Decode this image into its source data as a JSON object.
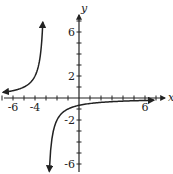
{
  "chart_data": {
    "type": "line",
    "title": "",
    "xlabel": "x",
    "ylabel": "y",
    "xlim": [
      -7,
      7
    ],
    "ylim": [
      -7,
      7
    ],
    "x_tick_labels": [
      "-6",
      "-4",
      "6"
    ],
    "y_tick_labels": [
      "6",
      "2",
      "-2",
      "-6"
    ],
    "grid": false,
    "function": "y = -2/(x+3)",
    "asymptotes": {
      "vertical": -3,
      "horizontal": 0
    },
    "series": [
      {
        "name": "left branch",
        "x": [
          -7,
          -6,
          -5,
          -4,
          -3.5,
          -3.3
        ],
        "y": [
          0.5,
          0.67,
          1,
          2,
          4,
          6.7
        ]
      },
      {
        "name": "right branch",
        "x": [
          -2.7,
          -2.5,
          -2,
          -1,
          0,
          2,
          4,
          6,
          7
        ],
        "y": [
          -6.7,
          -4,
          -2,
          -1,
          -0.67,
          -0.4,
          -0.29,
          -0.22,
          -0.2
        ]
      }
    ]
  },
  "axes": {
    "x_label": "x",
    "y_label": "y"
  },
  "ticks": {
    "x": [
      {
        "v": -6,
        "label": "-6"
      },
      {
        "v": -4,
        "label": "-4"
      },
      {
        "v": 6,
        "label": "6"
      }
    ],
    "y": [
      {
        "v": 6,
        "label": "6"
      },
      {
        "v": 2,
        "label": "2"
      },
      {
        "v": -2,
        "label": "-2"
      },
      {
        "v": -6,
        "label": "-6"
      }
    ]
  }
}
